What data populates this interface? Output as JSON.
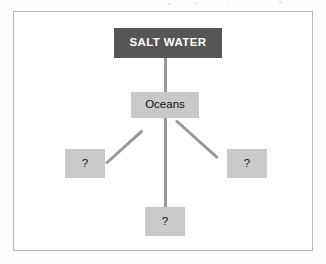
{
  "diagram": {
    "background_color": "#fefefe",
    "frame_color": "#b9b9bb",
    "connector_color": "#989898",
    "root": {
      "label": "SALT WATER",
      "fill": "#565656",
      "text_color": "#ffffff"
    },
    "main": {
      "label": "Oceans",
      "fill": "#c9c9c9",
      "text_color": "#111111"
    },
    "children": [
      {
        "label": "?",
        "position": "left",
        "fill": "#c9c9c9",
        "text_color": "#111111"
      },
      {
        "label": "?",
        "position": "bottom",
        "fill": "#c9c9c9",
        "text_color": "#111111"
      },
      {
        "label": "?",
        "position": "right",
        "fill": "#c9c9c9",
        "text_color": "#111111"
      }
    ]
  }
}
